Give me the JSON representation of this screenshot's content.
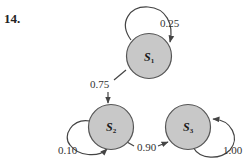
{
  "problem": {
    "number": "14."
  },
  "diagram": {
    "type": "markov-chain",
    "states": [
      {
        "id": "S1",
        "letter": "S",
        "sub": "1"
      },
      {
        "id": "S2",
        "letter": "S",
        "sub": "2"
      },
      {
        "id": "S3",
        "letter": "S",
        "sub": "3"
      }
    ],
    "transitions": [
      {
        "from": "S1",
        "to": "S1",
        "label": "0.25"
      },
      {
        "from": "S1",
        "to": "S2",
        "label": "0.75"
      },
      {
        "from": "S2",
        "to": "S2",
        "label": "0.10"
      },
      {
        "from": "S2",
        "to": "S3",
        "label": "0.90"
      },
      {
        "from": "S3",
        "to": "S3",
        "label": "1.00"
      }
    ],
    "colors": {
      "node_fill": "#c8c8c8",
      "node_stroke": "#555555",
      "edge": "#444444"
    }
  }
}
